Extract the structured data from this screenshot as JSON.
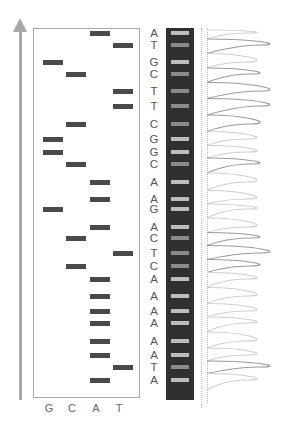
{
  "diagram": {
    "title": "",
    "direction_arrow": "up",
    "lane_labels": [
      "G",
      "C",
      "A",
      "T"
    ],
    "sequence": [
      "A",
      "T",
      "G",
      "C",
      "T",
      "T",
      "C",
      "G",
      "G",
      "C",
      "A",
      "A",
      "G",
      "A",
      "C",
      "T",
      "C",
      "A",
      "A",
      "A",
      "A",
      "A",
      "A",
      "T",
      "A"
    ],
    "colors": {
      "band": "#4a4a4a",
      "frame": "#a8a8a8",
      "strip": "#303030",
      "strip_band_light": "#bdbdbd",
      "strip_band_dark": "#8a8a8a",
      "peak_dark": "#9a9a9a",
      "peak_light": "#cfcfcf"
    }
  }
}
